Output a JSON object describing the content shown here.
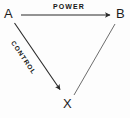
{
  "diagram": {
    "background_color": "#fdfdfd",
    "stroke_color": "#2a2a2a",
    "text_color": "#1c1c1c",
    "nodes": [
      {
        "id": "A",
        "label": "A",
        "x": 8,
        "y": 14
      },
      {
        "id": "B",
        "label": "B",
        "x": 120,
        "y": 14
      },
      {
        "id": "X",
        "label": "X",
        "x": 67,
        "y": 103
      }
    ],
    "edges": [
      {
        "id": "a-to-b",
        "from": "A",
        "to": "B",
        "label": "POWER",
        "arrowhead": "end",
        "x1": 21,
        "y1": 15,
        "x2": 112,
        "y2": 15
      },
      {
        "id": "a-to-x",
        "from": "A",
        "to": "X",
        "label": "CONTROL",
        "arrowhead": "end",
        "x1": 14,
        "y1": 23,
        "x2": 62,
        "y2": 93
      },
      {
        "id": "b-to-x",
        "from": "B",
        "to": "X",
        "label": "",
        "arrowhead": "none",
        "x1": 115,
        "y1": 24,
        "x2": 74,
        "y2": 94
      }
    ]
  }
}
